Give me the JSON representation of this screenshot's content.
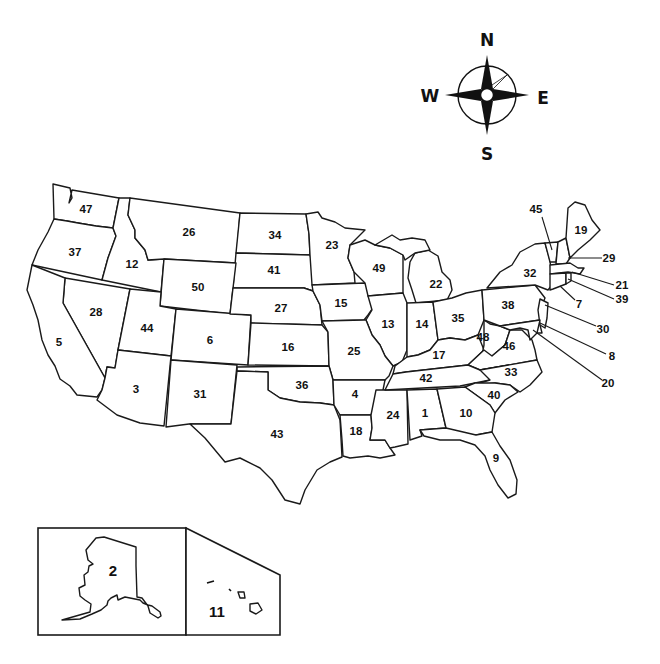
{
  "map": {
    "title": "",
    "type": "numbered outline map of the United States",
    "compass": {
      "north": "N",
      "south": "S",
      "east": "E",
      "west": "W"
    },
    "states": [
      {
        "number": "47",
        "x": 86,
        "y": 209
      },
      {
        "number": "37",
        "x": 75,
        "y": 252
      },
      {
        "number": "12",
        "x": 132,
        "y": 264
      },
      {
        "number": "26",
        "x": 189,
        "y": 232
      },
      {
        "number": "34",
        "x": 275,
        "y": 235
      },
      {
        "number": "23",
        "x": 332,
        "y": 245
      },
      {
        "number": "41",
        "x": 274,
        "y": 270
      },
      {
        "number": "50",
        "x": 198,
        "y": 287
      },
      {
        "number": "28",
        "x": 96,
        "y": 312
      },
      {
        "number": "5",
        "x": 59,
        "y": 342
      },
      {
        "number": "44",
        "x": 147,
        "y": 328
      },
      {
        "number": "6",
        "x": 210,
        "y": 340
      },
      {
        "number": "27",
        "x": 281,
        "y": 308
      },
      {
        "number": "16",
        "x": 288,
        "y": 347
      },
      {
        "number": "15",
        "x": 341,
        "y": 303
      },
      {
        "number": "49",
        "x": 379,
        "y": 268
      },
      {
        "number": "22",
        "x": 436,
        "y": 284
      },
      {
        "number": "13",
        "x": 388,
        "y": 324
      },
      {
        "number": "14",
        "x": 422,
        "y": 324
      },
      {
        "number": "35",
        "x": 458,
        "y": 318
      },
      {
        "number": "25",
        "x": 354,
        "y": 351
      },
      {
        "number": "48",
        "x": 483,
        "y": 337
      },
      {
        "number": "46",
        "x": 509,
        "y": 346
      },
      {
        "number": "17",
        "x": 439,
        "y": 355
      },
      {
        "number": "38",
        "x": 508,
        "y": 305
      },
      {
        "number": "32",
        "x": 530,
        "y": 273
      },
      {
        "number": "45",
        "x": 536,
        "y": 209
      },
      {
        "number": "19",
        "x": 581,
        "y": 230
      },
      {
        "number": "29",
        "x": 609,
        "y": 258
      },
      {
        "number": "21",
        "x": 622,
        "y": 285
      },
      {
        "number": "39",
        "x": 622,
        "y": 299
      },
      {
        "number": "7",
        "x": 579,
        "y": 304
      },
      {
        "number": "30",
        "x": 603,
        "y": 329
      },
      {
        "number": "8",
        "x": 612,
        "y": 356
      },
      {
        "number": "20",
        "x": 608,
        "y": 383
      },
      {
        "number": "36",
        "x": 302,
        "y": 385
      },
      {
        "number": "3",
        "x": 136,
        "y": 389
      },
      {
        "number": "31",
        "x": 200,
        "y": 394
      },
      {
        "number": "4",
        "x": 355,
        "y": 394
      },
      {
        "number": "42",
        "x": 426,
        "y": 378
      },
      {
        "number": "33",
        "x": 511,
        "y": 372
      },
      {
        "number": "40",
        "x": 494,
        "y": 395
      },
      {
        "number": "43",
        "x": 277,
        "y": 434
      },
      {
        "number": "18",
        "x": 356,
        "y": 431
      },
      {
        "number": "24",
        "x": 393,
        "y": 415
      },
      {
        "number": "1",
        "x": 425,
        "y": 413
      },
      {
        "number": "10",
        "x": 466,
        "y": 413
      },
      {
        "number": "9",
        "x": 496,
        "y": 458
      }
    ],
    "insets": [
      {
        "name": "alaska",
        "number": "2"
      },
      {
        "name": "hawaii",
        "number": "11"
      }
    ]
  }
}
